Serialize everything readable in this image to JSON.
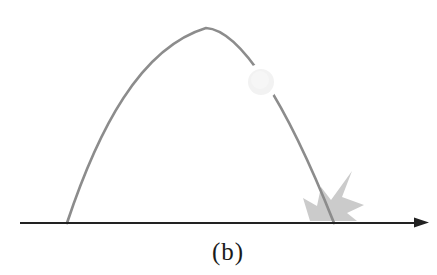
{
  "figure": {
    "caption": "(b)",
    "colors": {
      "background": "#ffffff",
      "trajectory": "#8c8c8c",
      "ball": "#f2f2f2",
      "ball_core": "#f6f6f6",
      "burst": "#cbcbcb",
      "ground": "#222222",
      "caption_text": "#1b1b1b"
    }
  }
}
